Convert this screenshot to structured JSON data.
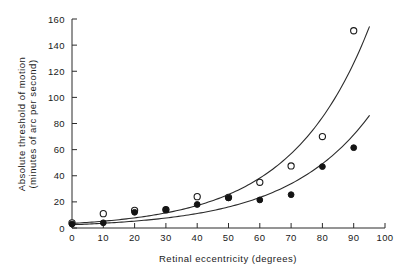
{
  "chart_data": {
    "type": "scatter",
    "title": "",
    "subtitle": "",
    "xlabel": "Retinal eccentricity  (degrees)",
    "ylabel_line1": "Absolute threshold of  motion",
    "ylabel_line2": "(minutes  of arc per second)",
    "ylabel": "Absolute threshold of motion (minutes of arc per second)",
    "xlim": [
      0,
      100
    ],
    "ylim": [
      0,
      160
    ],
    "xticks": [
      0,
      10,
      20,
      30,
      40,
      50,
      60,
      70,
      80,
      90,
      100
    ],
    "xtick_labels": [
      "0",
      "10",
      "20",
      "30",
      "40",
      "50",
      "60",
      "70",
      "80",
      "90",
      "100"
    ],
    "yticks": [
      0,
      20,
      40,
      60,
      80,
      100,
      120,
      140,
      160
    ],
    "ytick_labels": [
      "0",
      "20",
      "40",
      "60",
      "80",
      "100",
      "120",
      "140",
      "160"
    ],
    "grid": false,
    "legend": "none",
    "x": [
      0,
      10,
      20,
      30,
      40,
      50,
      60,
      70,
      80,
      90
    ],
    "series": [
      {
        "name": "open-circles",
        "marker": "open-circle",
        "color": "#1a1a1a",
        "values": [
          4,
          11,
          13.5,
          14,
          24,
          23.5,
          35,
          47.5,
          70,
          151
        ]
      },
      {
        "name": "filled-circles",
        "marker": "filled-circle",
        "color": "#141414",
        "values": [
          3,
          4,
          12,
          14,
          18,
          23,
          21.5,
          25.5,
          47,
          61.5
        ]
      }
    ],
    "fit_curves": [
      {
        "name": "upper-fit-curve",
        "for_series": "open-circles",
        "x_start": 0,
        "x_end": 95,
        "y_start": 3.5,
        "y_end": 154
      },
      {
        "name": "lower-fit-curve",
        "for_series": "filled-circles",
        "x_start": 0,
        "x_end": 95,
        "y_start": 2.5,
        "y_end": 86
      }
    ],
    "colors": {
      "axis": "#2b2b2b",
      "curve": "#2b2b2b",
      "text": "#1a1a1a",
      "background": "#ffffff"
    }
  }
}
